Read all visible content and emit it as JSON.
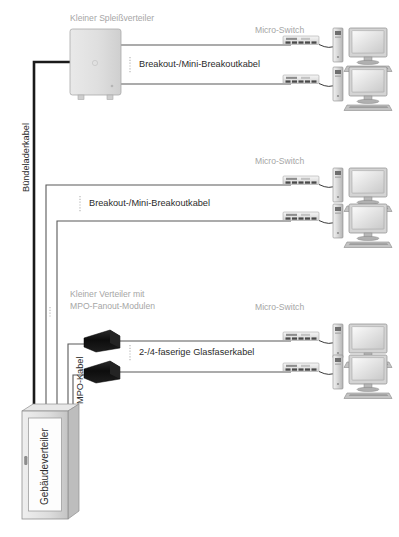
{
  "diagram": {
    "title_splice": "Kleiner Spleißverteiler",
    "label_trunk_cable": "Bündeladerkabel",
    "label_mpo_cable": "MPO-Kabel",
    "label_building_distributor": "Gebäudeverteiler",
    "label_distributor_mpo_line1": "Kleiner Verteiler mit",
    "label_distributor_mpo_line2": "MPO-Fanout-Modulen",
    "cable_label_breakout_1": "Breakout-/Mini-Breakoutkabel",
    "cable_label_breakout_2": "Breakout-/Mini-Breakoutkabel",
    "cable_label_fiber": "2-/4-faserige Glasfaserkabel",
    "switch_label_1": "Micro-Switch",
    "switch_label_2": "Micro-Switch",
    "switch_label_3": "Micro-Switch",
    "colors": {
      "trunk_cable": "#1a1a1a",
      "thin_cable": "#595959",
      "label_gray": "#a6a6a6",
      "label_dark": "#2b2b2b",
      "box_fill": "#dcdcdc",
      "mpo_module": "#111111",
      "cabinet_fill": "#d9d9d9",
      "background": "#ffffff"
    },
    "nodes": [
      {
        "name": "splice-distributor",
        "type": "enclosure",
        "label": "Kleiner Spleißverteiler"
      },
      {
        "name": "mpo-fanout-module-1",
        "type": "mpo-module"
      },
      {
        "name": "mpo-fanout-module-2",
        "type": "mpo-module"
      },
      {
        "name": "building-distributor",
        "type": "cabinet",
        "label": "Gebäudeverteiler"
      },
      {
        "name": "micro-switch-1",
        "type": "switch",
        "label": "Micro-Switch"
      },
      {
        "name": "micro-switch-2",
        "type": "switch"
      },
      {
        "name": "micro-switch-3",
        "type": "switch",
        "label": "Micro-Switch"
      },
      {
        "name": "micro-switch-4",
        "type": "switch"
      },
      {
        "name": "micro-switch-5",
        "type": "switch",
        "label": "Micro-Switch"
      },
      {
        "name": "micro-switch-6",
        "type": "switch"
      },
      {
        "name": "workstation-1",
        "type": "computer"
      },
      {
        "name": "workstation-2",
        "type": "computer"
      },
      {
        "name": "workstation-3",
        "type": "computer"
      },
      {
        "name": "workstation-4",
        "type": "computer"
      },
      {
        "name": "workstation-5",
        "type": "computer"
      },
      {
        "name": "workstation-6",
        "type": "computer"
      }
    ]
  }
}
